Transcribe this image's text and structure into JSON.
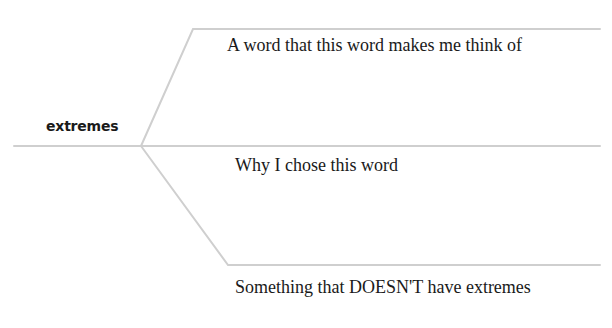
{
  "diagram": {
    "central_word": "extremes",
    "line_color": "#cfcfcf",
    "branches": [
      {
        "prompt": "A word that this word makes me think of"
      },
      {
        "prompt": "Why I chose this word"
      },
      {
        "prompt": "Something that DOESN'T have extremes"
      }
    ]
  }
}
